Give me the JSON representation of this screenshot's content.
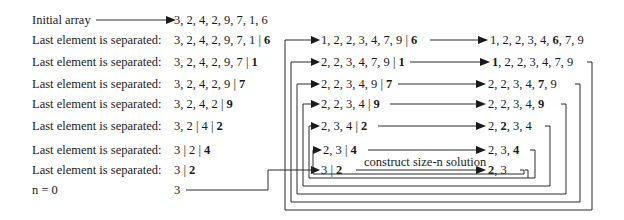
{
  "left_column": {
    "initial_label": "Initial array",
    "initial_array": "3, 2, 4, 2, 9, 7, 1, 6",
    "rows": [
      {
        "label": "Last element is separated:",
        "rest": "3, 2, 4, 2, 9, 7, 1 | ",
        "last": "6"
      },
      {
        "label": "Last element is separated:",
        "rest": "3, 2, 4, 2, 9, 7 | ",
        "last": "1"
      },
      {
        "label": "Last element is separated:",
        "rest": "3, 2, 4, 2, 9 | ",
        "last": "7"
      },
      {
        "label": "Last element is separated:",
        "rest": "3, 2, 4, 2 | ",
        "last": "9"
      },
      {
        "label": "Last element is separated:",
        "rest": "3, 2 | 4 | ",
        "last": "2"
      },
      {
        "label": "Last element is separated:",
        "rest": "3 | 2 | ",
        "last": "4"
      },
      {
        "label": "Last element is separated:",
        "rest": "3 | ",
        "last": "2"
      }
    ],
    "base_label": "n = 0",
    "base_value": "3"
  },
  "middle_column": {
    "rows": [
      {
        "sorted": "1, 2, 2, 3, 4, 7, 9 | ",
        "last": "6"
      },
      {
        "sorted": "2, 2, 3, 4, 7, 9 | ",
        "last": "1"
      },
      {
        "sorted": "2, 2, 3, 4, 9 | ",
        "last": "7"
      },
      {
        "sorted": "2, 2, 3, 4 | ",
        "last": "9"
      },
      {
        "sorted": "2, 3, 4 | ",
        "last": "2"
      },
      {
        "sorted": "2, 3 | ",
        "last": "4"
      },
      {
        "sorted": "3 | ",
        "last": "2"
      }
    ],
    "annotation": "construct size-n solution"
  },
  "right_column": {
    "rows": [
      {
        "pre": "1, 2, 2, 3, 4, ",
        "bold": "6",
        "post": ", 7, 9"
      },
      {
        "pre": "",
        "bold": "1",
        "post": ", 2, 2, 3, 4, 7, 9"
      },
      {
        "pre": "2, 2, 3, 4, ",
        "bold": "7",
        "post": ", 9"
      },
      {
        "pre": "2, 2, 3, 4, ",
        "bold": "9",
        "post": ""
      },
      {
        "pre": "2, ",
        "bold": "2",
        "post": ", 3, 4"
      },
      {
        "pre": "2, 3, ",
        "bold": "4",
        "post": ""
      },
      {
        "pre": "",
        "bold": "2",
        "post": ", 3"
      }
    ]
  },
  "colors": {
    "line": "#2a2a2a",
    "text": "#1a1a1a",
    "background": "#ffffff"
  }
}
